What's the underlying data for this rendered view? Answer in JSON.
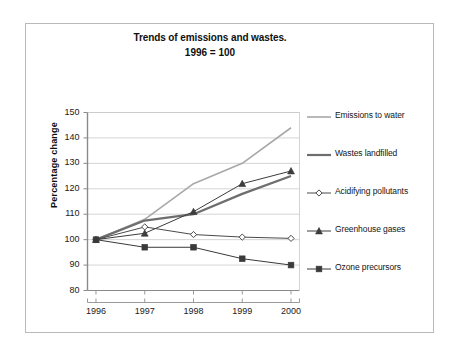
{
  "chart_data": {
    "type": "line",
    "title": "Trends of emissions and wastes.",
    "subtitle": "1996 = 100",
    "xlabel": "",
    "ylabel": "Percentage change",
    "categories": [
      "1996",
      "1997",
      "1998",
      "1999",
      "2000"
    ],
    "x": [
      1996,
      1997,
      1998,
      1999,
      2000
    ],
    "ylim": [
      80,
      150
    ],
    "yticks": [
      80,
      90,
      100,
      110,
      120,
      130,
      140,
      150
    ],
    "grid": true,
    "legend_position": "right",
    "series": [
      {
        "name": "Emissions to water",
        "values": [
          100,
          108,
          122,
          130,
          144
        ],
        "color": "#a8a8a8",
        "marker": "none",
        "width": 1.6
      },
      {
        "name": "Wastes landfilled",
        "values": [
          100,
          107.5,
          110,
          118,
          125
        ],
        "color": "#6e6e6e",
        "marker": "none",
        "width": 2.2
      },
      {
        "name": "Acidifying pollutants",
        "values": [
          100,
          105,
          102,
          101,
          100.5
        ],
        "color": "#4a4a4a",
        "marker": "diamond",
        "width": 1
      },
      {
        "name": "Greenhouse gases",
        "values": [
          100,
          102.5,
          111,
          122,
          127
        ],
        "color": "#3c3c3c",
        "marker": "triangle",
        "width": 1
      },
      {
        "name": "Ozone precursors",
        "values": [
          100,
          97,
          97,
          92.5,
          90
        ],
        "color": "#3a3a3a",
        "marker": "square",
        "width": 1
      }
    ]
  },
  "axes": {
    "y_tick_labels": [
      "150",
      "140",
      "130",
      "120",
      "110",
      "100",
      "90",
      "80"
    ],
    "x_tick_labels": [
      "1996",
      "1997",
      "1998",
      "1999",
      "2000"
    ]
  },
  "colors": {
    "frame": "#b9b9b9",
    "grid": "#c9c9c9",
    "axis": "#8a8a8a",
    "text": "#1a1a1a"
  }
}
